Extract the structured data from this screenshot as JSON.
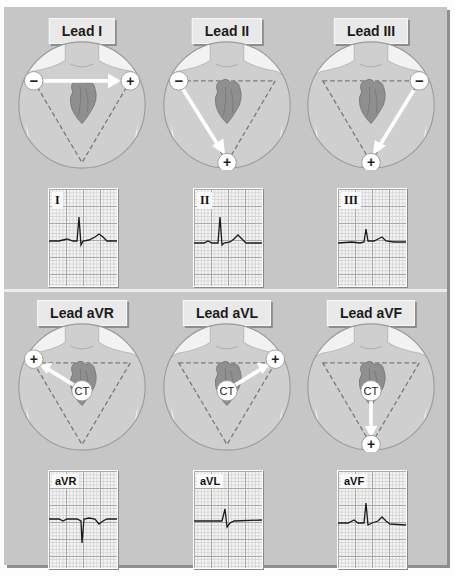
{
  "figure": {
    "leads": [
      {
        "title": "Lead I",
        "ecg_label": "I",
        "negative": "−",
        "positive": "+"
      },
      {
        "title": "Lead II",
        "ecg_label": "II",
        "negative": "−",
        "positive": "+"
      },
      {
        "title": "Lead III",
        "ecg_label": "III",
        "negative": "−",
        "positive": "+"
      },
      {
        "title": "Lead aVR",
        "ecg_label": "aVR",
        "center": "CT",
        "positive": "+"
      },
      {
        "title": "Lead aVL",
        "ecg_label": "aVL",
        "center": "CT",
        "positive": "+"
      },
      {
        "title": "Lead aVF",
        "ecg_label": "aVF",
        "center": "CT",
        "positive": "+"
      }
    ],
    "colors": {
      "panel": "#c6c6c6",
      "label_bg": "#e9e9e9",
      "trace": "#1a1a1a",
      "heart": "#8f8f8f",
      "triangle": "#7a7a7a"
    }
  }
}
